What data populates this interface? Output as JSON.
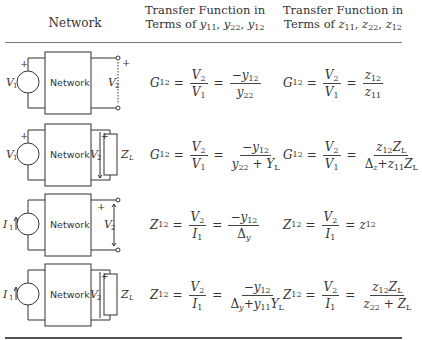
{
  "table": {
    "headers": {
      "network": "Network",
      "y_col_line1": "Transfer Function in",
      "y_col_line2_prefix": "Terms of ",
      "y_col_vars": [
        "y11",
        "y22",
        "y12"
      ],
      "z_col_line1": "Transfer Function in",
      "z_col_line2_prefix": "Terms of ",
      "z_col_vars": [
        "z11",
        "z22",
        "z12"
      ]
    },
    "rows": [
      {
        "circuit": {
          "source": "V1",
          "source_type": "voltage",
          "box_label": "Network",
          "output": "V2",
          "load": null,
          "output_terminals": "open"
        },
        "y_formula": "G12 = V2/V1 = -y12 / y22",
        "z_formula": "G12 = V2/V1 = z12 / z11"
      },
      {
        "circuit": {
          "source": "V1",
          "source_type": "voltage",
          "box_label": "Network",
          "output": "V2",
          "load": "ZL"
        },
        "y_formula": "G12 = V2/V1 = -y12 / (y22 + YL)",
        "z_formula": "G12 = V2/V1 = z12 ZL / (Δz + z11 ZL)"
      },
      {
        "circuit": {
          "source": "I1",
          "source_type": "current",
          "box_label": "Network",
          "output": "V2",
          "load": null,
          "output_terminals": "open"
        },
        "y_formula": "Z12 = V2/I1 = -y12 / Δy",
        "z_formula": "Z12 = V2/I1 = z12"
      },
      {
        "circuit": {
          "source": "I1",
          "source_type": "current",
          "box_label": "Network",
          "output": "V2",
          "load": "ZL"
        },
        "y_formula": "Z12 = V2/I1 = -y12 / (Δy + y11 YL)",
        "z_formula": "Z12 = V2/I1 = z12 ZL / (z22 + ZL)"
      }
    ],
    "box_label": "Network"
  }
}
